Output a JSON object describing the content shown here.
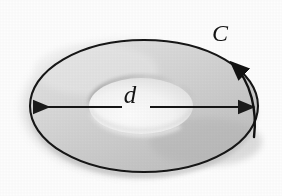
{
  "figure": {
    "kind": "annulus-perspective-diagram",
    "caption_visible": false,
    "background_color": "#fdfdfd",
    "ink_color": "#1a1a1a",
    "labels": {
      "diameter": "d",
      "contour": "C"
    },
    "annotations": {
      "diameter_arrow": {
        "name": "double-headed-diameter-arrow",
        "from_x": 32,
        "to_x": 256,
        "y": 107,
        "arrowheads": "both"
      },
      "contour_arrow": {
        "name": "counterclockwise-contour-arrow",
        "arrowhead_x": 226,
        "arrowhead_y": 60,
        "direction": "counterclockwise"
      }
    },
    "shapes": {
      "outer_ellipse": {
        "name": "outer-disc-ellipse",
        "cx": 144,
        "cy": 108,
        "rx": 114,
        "ry": 68,
        "fill_color": "#cfcfcf",
        "stroke_color": "#1a1a1a"
      },
      "inner_ellipse": {
        "name": "center-hole-ellipse",
        "cx": 141,
        "cy": 105,
        "rx": 53,
        "ry": 29,
        "fill_color": "#fafafa",
        "rim_shadow_color": "#8d8d8d"
      },
      "drop_shadow": {
        "name": "disc-drop-shadow",
        "color": "#c6c6c6"
      }
    }
  }
}
